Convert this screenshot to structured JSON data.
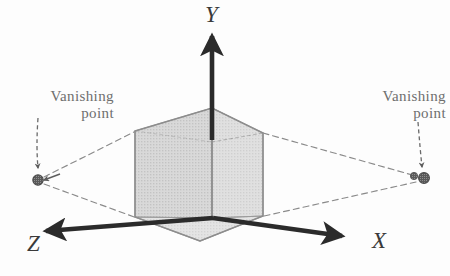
{
  "figure": {
    "type": "diagram",
    "background_color": "#fdfdfd",
    "labels": {
      "vanishing_left": {
        "line1": "Vanishing",
        "line2": "point"
      },
      "vanishing_right": {
        "line1": "Vanishing",
        "line2": "point"
      }
    },
    "axes": {
      "y": {
        "label": "Y",
        "direction": "up",
        "color": "#2b2b2b"
      },
      "x": {
        "label": "X",
        "direction": "right",
        "color": "#2b2b2b"
      },
      "z": {
        "label": "Z",
        "direction": "left",
        "color": "#2b2b2b"
      }
    },
    "cube": {
      "name": "perspective-cube",
      "fill_color": "#c9c9c9",
      "stroke_color": "#8d8d8d",
      "opacity": 0.55
    },
    "vanishing_points": {
      "left": {
        "name": "vanishing-point-left-marker",
        "color": "#595959"
      },
      "right": {
        "name": "vanishing-point-right-marker",
        "color": "#595959"
      }
    },
    "guide_lines": {
      "style": "dashed",
      "color": "#8a8a8a"
    },
    "label_color": "#6e6e6e"
  },
  "geometry": {
    "origin": {
      "x": 213,
      "y": 218
    },
    "cube_top": {
      "x": 212,
      "y": 108
    },
    "cube_bottom": {
      "x": 200,
      "y": 241
    },
    "cube_left_top": {
      "x": 135,
      "y": 131
    },
    "cube_left_bot": {
      "x": 135,
      "y": 217
    },
    "cube_right_top": {
      "x": 263,
      "y": 133
    },
    "cube_right_bot": {
      "x": 263,
      "y": 216
    },
    "vp_left": {
      "x": 38,
      "y": 180
    },
    "vp_right": {
      "x": 422,
      "y": 178
    },
    "y_arrow_tip": {
      "x": 212,
      "y": 32
    },
    "x_arrow_tip": {
      "x": 345,
      "y": 237
    },
    "z_arrow_tip": {
      "x": 42,
      "y": 233
    }
  }
}
